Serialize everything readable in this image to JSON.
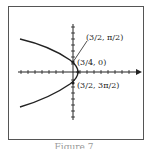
{
  "figure": {
    "caption": "Figure 7",
    "points": [
      {
        "label": "(3/2, π/2)",
        "r": "3/2",
        "theta": "π/2"
      },
      {
        "label": "(3/4, 0)",
        "r": "3/4",
        "theta": "0"
      },
      {
        "label": "(3/2, 3π/2)",
        "r": "3/2",
        "theta": "3π/2"
      }
    ],
    "curve": "parabola opening left (polar conic)",
    "axes": {
      "x_ticks": 14,
      "y_ticks": 14
    }
  }
}
